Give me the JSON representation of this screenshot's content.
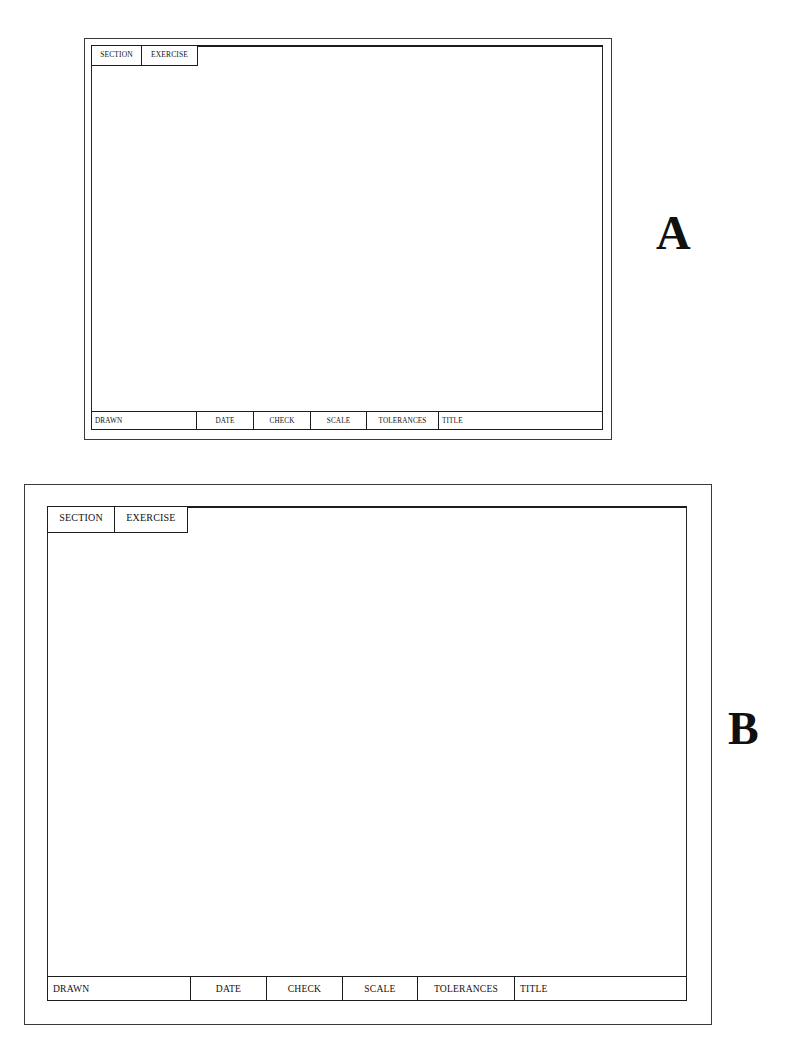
{
  "page": {
    "background_color": "#ffffff",
    "line_color": "#1c1c1c"
  },
  "figures": [
    {
      "id": "a",
      "letter": "A",
      "header": {
        "cells": [
          {
            "label": "SECTION"
          },
          {
            "label": "EXERCISE"
          }
        ]
      },
      "title_block": {
        "cells": [
          {
            "label": "DRAWN"
          },
          {
            "label": "DATE"
          },
          {
            "label": "CHECK"
          },
          {
            "label": "SCALE"
          },
          {
            "label": "TOLERANCES"
          },
          {
            "label": "TITLE"
          }
        ]
      }
    },
    {
      "id": "b",
      "letter": "B",
      "header": {
        "cells": [
          {
            "label": "SECTION"
          },
          {
            "label": "EXERCISE"
          }
        ]
      },
      "title_block": {
        "cells": [
          {
            "label": "DRAWN"
          },
          {
            "label": "DATE"
          },
          {
            "label": "CHECK"
          },
          {
            "label": "SCALE"
          },
          {
            "label": "TOLERANCES"
          },
          {
            "label": "TITLE"
          }
        ]
      }
    }
  ]
}
